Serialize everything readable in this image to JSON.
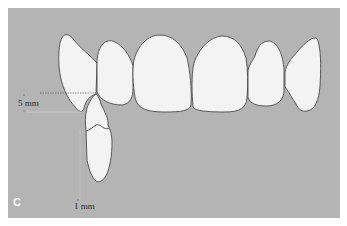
{
  "figure": {
    "panel_label": "C",
    "background_color": "#b4b4b4",
    "tooth_fill": "#f2f2f2",
    "outline_color": "#4a4a4a",
    "measurements": [
      {
        "value": "5",
        "unit": "mm",
        "label": "5 mm",
        "axis": "vertical"
      },
      {
        "value": "1",
        "unit": "mm",
        "label": "1 mm",
        "axis": "horizontal"
      }
    ],
    "teeth": [
      {
        "id": "upper-right-canine",
        "arch": "upper"
      },
      {
        "id": "upper-right-lateral",
        "arch": "upper"
      },
      {
        "id": "upper-right-central",
        "arch": "upper"
      },
      {
        "id": "upper-left-central",
        "arch": "upper"
      },
      {
        "id": "upper-left-lateral",
        "arch": "upper"
      },
      {
        "id": "upper-left-canine",
        "arch": "upper"
      },
      {
        "id": "lower-tooth",
        "arch": "lower"
      }
    ]
  }
}
